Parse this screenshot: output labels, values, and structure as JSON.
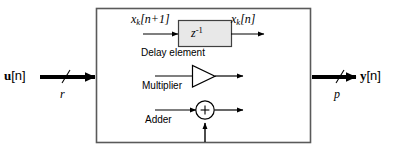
{
  "figure": {
    "type": "block-diagram",
    "background_color": "#ffffff",
    "border_color": "#5a5a5a",
    "line_color": "#000000",
    "delay_fill_color": "#e8e8e8"
  },
  "io": {
    "input": {
      "label_bold": "u",
      "label_index": "[n]",
      "bus_width_symbol": "r",
      "arrow_direction": "right"
    },
    "output": {
      "label_bold": "y",
      "label_index": "[n]",
      "bus_width_symbol": "p",
      "arrow_direction": "right"
    }
  },
  "legend": {
    "delay": {
      "caption": "Delay element",
      "block_symbol_base": "z",
      "block_symbol_exponent": "-1",
      "input_var": "x",
      "input_sub": "k",
      "input_index": "[n+1]",
      "output_var": "x",
      "output_sub": "k",
      "output_index": "[n]"
    },
    "multiplier": {
      "caption": "Multiplier",
      "shape": "triangle"
    },
    "adder": {
      "caption": "Adder",
      "shape": "circle",
      "operator": "+"
    }
  }
}
